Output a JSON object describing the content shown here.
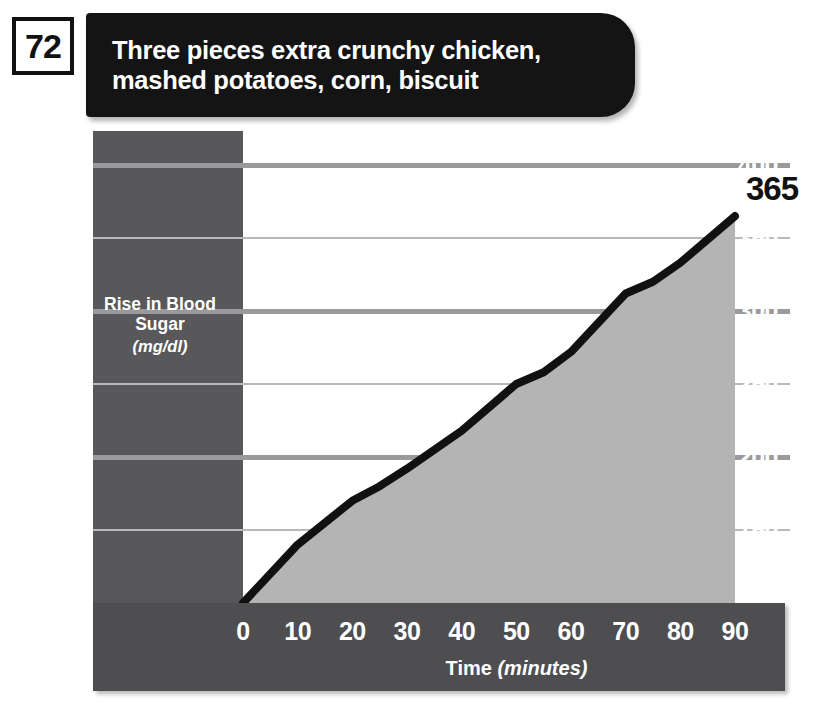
{
  "page_number": "72",
  "header": {
    "title_line1": "Three pieces extra crunchy chicken,",
    "title_line2": "mashed potatoes, corn, biscuit"
  },
  "end_label": "365",
  "colors": {
    "title_bar": "#141414",
    "left_panel": "#58585a",
    "bottom_panel": "#4e4e50",
    "area_fill": "#b4b4b4",
    "curve": "#111111",
    "gridline_major": "#9a9a9c",
    "gridline_minor": "#b9b9bb",
    "tick_text": "#ffffff"
  },
  "chart_data": {
    "type": "area",
    "title": "Three pieces extra crunchy chicken, mashed potatoes, corn, biscuit",
    "xlabel": "Time",
    "xlabel_units": "(minutes)",
    "ylabel": "Rise in Blood Sugar",
    "ylabel_units": "(mg/dl)",
    "xlim": [
      0,
      90
    ],
    "ylim": [
      100,
      400
    ],
    "xticks": [
      0,
      10,
      20,
      30,
      40,
      50,
      60,
      70,
      80,
      90
    ],
    "yticks": [
      100,
      150,
      200,
      250,
      300,
      350,
      400
    ],
    "ytick_major": [
      200,
      300,
      400
    ],
    "ytick_minor": [
      150,
      250,
      350
    ],
    "grid": true,
    "legend": false,
    "x": [
      0,
      10,
      20,
      25,
      30,
      40,
      50,
      55,
      60,
      70,
      75,
      80,
      90
    ],
    "y": [
      100,
      140,
      170,
      180,
      192,
      218,
      250,
      258,
      272,
      312,
      320,
      333,
      365
    ],
    "series": [
      {
        "name": "Rise in Blood Sugar",
        "values": [
          100,
          140,
          170,
          180,
          192,
          218,
          250,
          258,
          272,
          312,
          320,
          333,
          365
        ]
      }
    ],
    "annotations": [
      {
        "text": "365",
        "x": 90,
        "y": 365
      }
    ]
  }
}
